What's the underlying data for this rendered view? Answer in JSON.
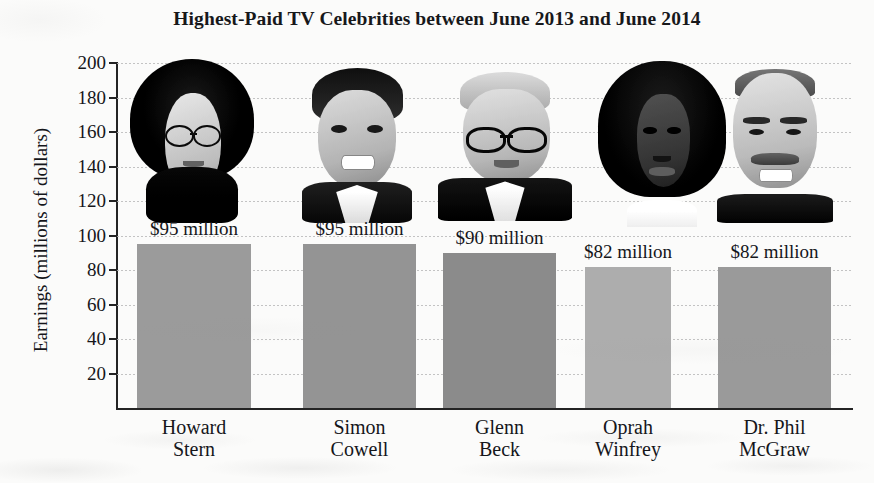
{
  "chart_data": {
    "type": "bar",
    "title": "Highest-Paid TV Celebrities between June 2013 and June 2014",
    "xlabel": "",
    "ylabel": "Earnings (millions of dollars)",
    "categories": [
      "Howard Stern",
      "Simon Cowell",
      "Glenn Beck",
      "Oprah Winfrey",
      "Dr. Phil McGraw"
    ],
    "values": [
      95,
      95,
      90,
      82,
      82
    ],
    "value_labels": [
      "$95 million",
      "$95 million",
      "$90 million",
      "$82 million",
      "$82 million"
    ],
    "ylim": [
      0,
      200
    ],
    "yticks": [
      20,
      40,
      60,
      80,
      100,
      120,
      140,
      160,
      180,
      200
    ],
    "ytick_labels": [
      "20",
      "40",
      "60",
      "80",
      "100",
      "120",
      "140",
      "160",
      "180",
      "200"
    ],
    "grid": true,
    "legend": "none",
    "bar_colors": [
      "#9b9b9b",
      "#949494",
      "#8b8b8b",
      "#adadad",
      "#9a9a9a"
    ]
  },
  "axis": {
    "y_title": "Earnings (millions of dollars)",
    "ticks": [
      {
        "label": "200",
        "value": 200
      },
      {
        "label": "180",
        "value": 180
      },
      {
        "label": "160",
        "value": 160
      },
      {
        "label": "140",
        "value": 140
      },
      {
        "label": "120",
        "value": 120
      },
      {
        "label": "100",
        "value": 100
      },
      {
        "label": "80",
        "value": 80
      },
      {
        "label": "60",
        "value": 60
      },
      {
        "label": "40",
        "value": 40
      },
      {
        "label": "20",
        "value": 20
      }
    ]
  },
  "bars": [
    {
      "name_line1": "Howard",
      "name_line2": "Stern",
      "value_label": "$95 million",
      "value": 95,
      "photo": "portrait-howard-stern"
    },
    {
      "name_line1": "Simon",
      "name_line2": "Cowell",
      "value_label": "$95 million",
      "value": 95,
      "photo": "portrait-simon-cowell"
    },
    {
      "name_line1": "Glenn",
      "name_line2": "Beck",
      "value_label": "$90 million",
      "value": 90,
      "photo": "portrait-glenn-beck"
    },
    {
      "name_line1": "Oprah",
      "name_line2": "Winfrey",
      "value_label": "$82 million",
      "value": 82,
      "photo": "portrait-oprah-winfrey"
    },
    {
      "name_line1": "Dr. Phil",
      "name_line2": "McGraw",
      "value_label": "$82 million",
      "value": 82,
      "photo": "portrait-dr-phil-mcgraw"
    }
  ],
  "colors": {
    "background": "#fbfbfa",
    "axis": "#242424",
    "gridline": "#b9b9b9",
    "text": "#15161a"
  }
}
